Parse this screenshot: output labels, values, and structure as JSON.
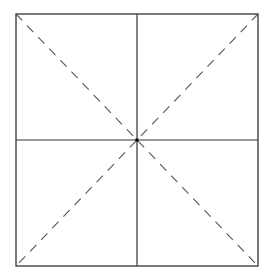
{
  "diagram": {
    "type": "square-with-midlines-and-diagonals",
    "square": {
      "x": 16,
      "y": 14,
      "width": 242,
      "height": 252
    },
    "center": {
      "x": 137,
      "y": 140
    },
    "colors": {
      "solid_line": "#333333",
      "dashed_line": "#555555",
      "background": "#ffffff",
      "center_dot": "#000000"
    },
    "lines": {
      "outer_border": "solid",
      "vertical_midline": "solid",
      "horizontal_midline": "solid",
      "diagonal_tl_br": "dashed",
      "diagonal_tr_bl": "dashed"
    }
  }
}
